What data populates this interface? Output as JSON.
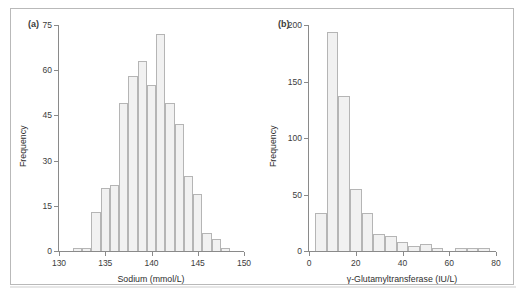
{
  "figure": {
    "background_color": "#ffffff",
    "frame_color": "#b9b9b9",
    "bar_fill_color": "#f1f1f1",
    "bar_edge_color": "#b5b5b5",
    "axis_color": "#8a8a8a",
    "text_color": "#2e2e2e"
  },
  "panels": {
    "a": {
      "tag": "(a)",
      "xlabel": "Sodium (mmol/L)",
      "ylabel": "Frequency",
      "xticks": [
        "130",
        "135",
        "140",
        "145",
        "150"
      ],
      "yticks": [
        "0",
        "15",
        "30",
        "45",
        "60",
        "75"
      ]
    },
    "b": {
      "tag": "(b)",
      "xlabel": "γ-Glutamyltransferase (IU/L)",
      "ylabel": "Frequency",
      "xticks": [
        "0",
        "20",
        "40",
        "60",
        "80"
      ],
      "yticks": [
        "0",
        "50",
        "100",
        "150",
        "200"
      ]
    }
  },
  "chart_data": [
    {
      "type": "bar",
      "panel": "a",
      "title": "",
      "subtitle": "",
      "xlabel": "Sodium (mmol/L)",
      "ylabel": "Frequency",
      "xlim": [
        130,
        150
      ],
      "ylim": [
        0,
        75
      ],
      "xticks": [
        130,
        135,
        140,
        145,
        150
      ],
      "yticks": [
        0,
        15,
        30,
        45,
        60,
        75
      ],
      "grid": false,
      "legend": null,
      "bin_width": 1,
      "bin_centers": [
        132,
        133,
        134,
        135,
        136,
        137,
        138,
        139,
        140,
        141,
        142,
        143,
        144,
        145,
        146,
        147,
        148
      ],
      "values": [
        1,
        1,
        13,
        21,
        22,
        49,
        58,
        63,
        55,
        72,
        49,
        42,
        25,
        19,
        6,
        4,
        1
      ]
    },
    {
      "type": "bar",
      "panel": "b",
      "title": "",
      "subtitle": "",
      "xlabel": "γ-Glutamyltransferase (IU/L)",
      "ylabel": "Frequency",
      "xlim": [
        0,
        80
      ],
      "ylim": [
        0,
        200
      ],
      "xticks": [
        0,
        20,
        40,
        60,
        80
      ],
      "yticks": [
        0,
        50,
        100,
        150,
        200
      ],
      "grid": false,
      "legend": null,
      "bin_width": 5,
      "bin_centers": [
        5,
        10,
        15,
        20,
        25,
        30,
        35,
        40,
        45,
        50,
        55,
        60,
        65,
        70,
        75
      ],
      "values": [
        34,
        194,
        137,
        55,
        34,
        15,
        13,
        8,
        4,
        6,
        3,
        0,
        3,
        3,
        3
      ]
    }
  ]
}
